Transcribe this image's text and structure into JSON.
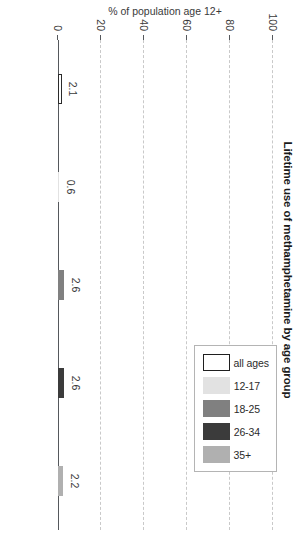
{
  "chart_data": {
    "type": "bar",
    "orientation": "vertical",
    "title": "Lifetime use of methamphetamine by age group",
    "xlabel": "",
    "ylabel": "% of population age 12+",
    "categories": [
      "all ages",
      "12-17",
      "18-25",
      "26-34",
      "35+"
    ],
    "values": [
      2.1,
      0.6,
      2.6,
      2.6,
      2.2
    ],
    "value_labels": [
      "2.1",
      "0.6",
      "2.6",
      "2.6",
      "2.2"
    ],
    "ylim": [
      0,
      100
    ],
    "yticks": [
      0,
      20,
      40,
      60,
      80,
      100
    ],
    "ytick_labels": [
      "0",
      "20",
      "40",
      "60",
      "80",
      "100"
    ],
    "grid": true,
    "grid_axis": "y",
    "legend_position": "top-right",
    "series": [
      {
        "name": "all ages",
        "value": 2.1,
        "color": "#ffffff",
        "edgecolor": "#2b2b2b"
      },
      {
        "name": "12-17",
        "value": 0.6,
        "color": "#e2e2e2",
        "edgecolor": "#e2e2e2"
      },
      {
        "name": "18-25",
        "value": 2.6,
        "color": "#808080",
        "edgecolor": "#808080"
      },
      {
        "name": "26-34",
        "value": 2.6,
        "color": "#3b3b3b",
        "edgecolor": "#3b3b3b"
      },
      {
        "name": "35+",
        "value": 2.2,
        "color": "#b0b0b0",
        "edgecolor": "#b0b0b0"
      }
    ]
  },
  "legend": {
    "items": [
      {
        "label": "all ages",
        "color": "#ffffff",
        "outlined": true
      },
      {
        "label": "12-17",
        "color": "#e2e2e2",
        "outlined": false
      },
      {
        "label": "18-25",
        "color": "#808080",
        "outlined": false
      },
      {
        "label": "26-34",
        "color": "#3b3b3b",
        "outlined": false
      },
      {
        "label": "35+",
        "color": "#b0b0b0",
        "outlined": false
      }
    ]
  },
  "axis": {
    "value_axis_title": "% of population age 12+",
    "ticks": [
      "100",
      "80",
      "60",
      "40",
      "20",
      "0"
    ]
  },
  "colors": {
    "axis": "#55585c",
    "grid": "#c9c9c9",
    "text": "#3a3a3a",
    "title": "#1a1a1a",
    "background": "#ffffff",
    "legend_border": "#b4b4b4"
  }
}
